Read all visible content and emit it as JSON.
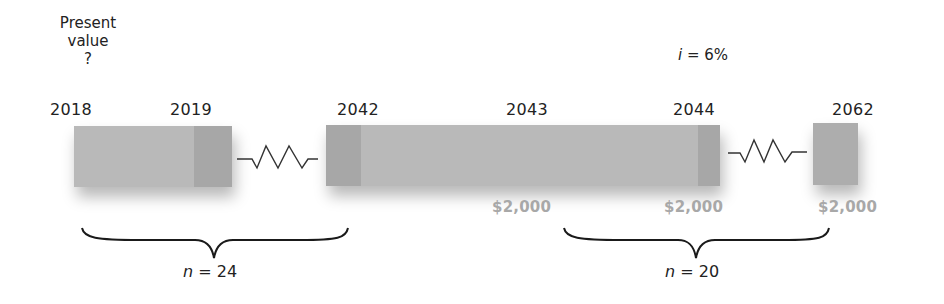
{
  "present_value_label": {
    "line1": "Present",
    "line2": "value",
    "line3": "?"
  },
  "interest_rate": {
    "symbol": "i",
    "equals": " = 6%",
    "value_pct": 6
  },
  "years": {
    "y2018": "2018",
    "y2019": "2019",
    "y2042": "2042",
    "y2043": "2043",
    "y2044": "2044",
    "y2062": "2062"
  },
  "payments": {
    "p2043": "$2,000",
    "p2044": "$2,000",
    "p2062": "$2,000"
  },
  "periods": {
    "deferral": {
      "symbol": "n",
      "equals": " = 24",
      "value": 24
    },
    "annuity": {
      "symbol": "n",
      "equals": " = 20",
      "value": 20
    }
  },
  "colors": {
    "bar": "#b9b9b9",
    "bar_segment": "#a7a7a7",
    "payment_text": "#a8a8a8",
    "text": "#222222"
  }
}
